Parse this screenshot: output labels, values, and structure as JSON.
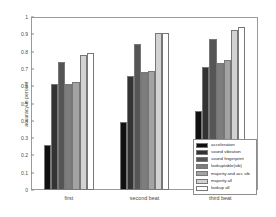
{
  "chart_data": {
    "type": "bar",
    "title": "",
    "xlabel": "",
    "ylabel": "accuracy in percent",
    "categories": [
      "first",
      "second beat",
      "third beat"
    ],
    "ylim": [
      0,
      1
    ],
    "ytick_labels": [
      "0",
      "0.1",
      "0.2",
      "0.3",
      "0.4",
      "0.5",
      "0.6",
      "0.7",
      "0.8",
      "0.9",
      "1"
    ],
    "ytick_values": [
      0,
      0.1,
      0.2,
      0.3,
      0.4,
      0.5,
      0.6,
      0.7,
      0.8,
      0.9,
      1
    ],
    "grid": false,
    "legend_position": "lower right",
    "series": [
      {
        "name": "acceleration",
        "color": "#101010",
        "values": [
          0.26,
          0.395,
          0.455
        ]
      },
      {
        "name": "sound vibration",
        "color": "#333333",
        "values": [
          0.61,
          0.66,
          0.71
        ]
      },
      {
        "name": "sound fingerprint",
        "color": "#555555",
        "values": [
          0.74,
          0.845,
          0.875
        ]
      },
      {
        "name": "lookuptable(vib)",
        "color": "#7d7d7d",
        "values": [
          0.615,
          0.685,
          0.735
        ]
      },
      {
        "name": "majority and acc vib",
        "color": "#a3a3a3",
        "values": [
          0.625,
          0.69,
          0.75
        ]
      },
      {
        "name": "majority all",
        "color": "#d2d2d2",
        "values": [
          0.78,
          0.905,
          0.925
        ]
      },
      {
        "name": "lookup all",
        "color": "#ffffff",
        "values": [
          0.79,
          0.91,
          0.94
        ]
      }
    ]
  }
}
